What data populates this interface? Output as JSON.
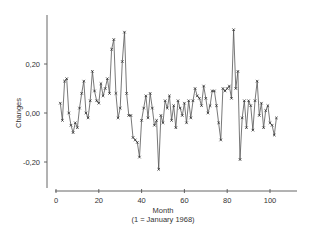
{
  "chart_data": {
    "type": "line",
    "title": "",
    "xlabel": "Month",
    "xlabel_sub": "(1 = January 1968)",
    "ylabel": "Changes",
    "xlim": [
      0,
      112
    ],
    "ylim": [
      -0.3,
      0.4
    ],
    "xticks": [
      0,
      20,
      40,
      60,
      80,
      100
    ],
    "xtick_labels": [
      "0",
      "20",
      "40",
      "60",
      "80",
      "100"
    ],
    "yticks": [
      0.2,
      0.0,
      -0.2
    ],
    "ytick_labels": [
      "0,20",
      "0,00",
      "-0,20"
    ],
    "grid": false,
    "legend": "none",
    "marker": "x",
    "line_color": "#555555",
    "marker_color": "#222222",
    "series": [
      {
        "name": "Changes",
        "x": [
          2,
          3,
          4,
          5,
          6,
          7,
          8,
          9,
          10,
          11,
          12,
          13,
          14,
          15,
          16,
          17,
          18,
          19,
          20,
          21,
          22,
          23,
          24,
          25,
          26,
          27,
          28,
          29,
          30,
          31,
          32,
          33,
          34,
          35,
          36,
          37,
          38,
          39,
          40,
          41,
          42,
          43,
          44,
          45,
          46,
          47,
          48,
          49,
          50,
          51,
          52,
          53,
          54,
          55,
          56,
          57,
          58,
          59,
          60,
          61,
          62,
          63,
          64,
          65,
          66,
          67,
          68,
          69,
          70,
          71,
          72,
          73,
          74,
          75,
          76,
          77,
          78,
          79,
          80,
          81,
          82,
          83,
          84,
          85,
          86,
          87,
          88,
          89,
          90,
          91,
          92,
          93,
          94,
          95,
          96,
          97,
          98,
          99,
          100,
          101,
          102,
          103
        ],
        "values": [
          0.04,
          -0.03,
          0.13,
          0.14,
          0.0,
          -0.05,
          -0.08,
          -0.04,
          -0.06,
          0.02,
          0.08,
          0.13,
          0.0,
          -0.02,
          0.05,
          0.17,
          0.09,
          0.05,
          0.04,
          0.12,
          0.07,
          0.1,
          0.14,
          0.08,
          0.26,
          0.3,
          0.08,
          -0.02,
          0.02,
          0.21,
          0.33,
          0.08,
          -0.01,
          -0.01,
          -0.1,
          -0.11,
          -0.12,
          -0.18,
          -0.03,
          0.02,
          0.07,
          -0.02,
          0.08,
          0.02,
          -0.05,
          -0.03,
          -0.23,
          -0.01,
          -0.04,
          0.05,
          0.02,
          0.07,
          -0.03,
          0.03,
          -0.06,
          0.05,
          0.02,
          -0.01,
          0.04,
          -0.04,
          0.05,
          -0.02,
          0.05,
          0.1,
          0.07,
          0.06,
          0.03,
          0.11,
          0.06,
          0.0,
          0.03,
          0.09,
          0.09,
          0.03,
          -0.04,
          -0.11,
          0.1,
          0.09,
          0.1,
          0.11,
          0.06,
          0.34,
          0.1,
          0.17,
          -0.19,
          -0.02,
          0.05,
          -0.06,
          0.05,
          0.03,
          -0.07,
          0.05,
          0.13,
          -0.01,
          0.04,
          -0.06,
          0.01,
          0.03,
          -0.04,
          -0.05,
          -0.09,
          -0.02
        ]
      }
    ]
  }
}
